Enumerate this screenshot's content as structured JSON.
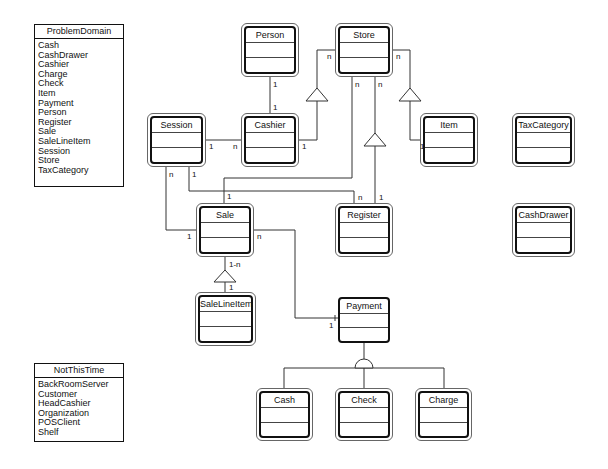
{
  "problem_domain": {
    "title": "ProblemDomain",
    "items": [
      "Cash",
      "CashDrawer",
      "Cashier",
      "Charge",
      "Check",
      "Item",
      "Payment",
      "Person",
      "Register",
      "Sale",
      "SaleLineItem",
      "Session",
      "Store",
      "TaxCategory"
    ]
  },
  "not_this_time": {
    "title": "NotThisTime",
    "items": [
      "BackRoomServer",
      "Customer",
      "HeadCashier",
      "Organization",
      "POSClient",
      "Shelf"
    ]
  },
  "classes": {
    "person": "Person",
    "store": "Store",
    "session": "Session",
    "cashier": "Cashier",
    "item": "Item",
    "tax_category": "TaxCategory",
    "sale": "Sale",
    "register": "Register",
    "cash_drawer": "CashDrawer",
    "sale_line_item": "SaleLineItem",
    "payment": "Payment",
    "cash": "Cash",
    "check": "Check",
    "charge": "Charge"
  },
  "multiplicities": {
    "person_cashier_top": "1",
    "person_cashier_bottom": "1",
    "session_cashier_session": "1",
    "session_cashier_cashier": "n",
    "cashier_store_cashier": "1",
    "cashier_store_store": "n",
    "store_item_store": "n",
    "store_item_item": "1",
    "store_sale_store": "n",
    "store_register_store": "n",
    "session_sale_session": "n",
    "session_register_session": "1",
    "sale_from_store": "1",
    "register_from_session": "n",
    "register_from_store": "1",
    "sale_session_sale": "1",
    "sale_payment_sale": "n",
    "sale_payment_payment": "1",
    "sale_lineitem_sale": "1-n",
    "sale_lineitem_item": "1"
  }
}
